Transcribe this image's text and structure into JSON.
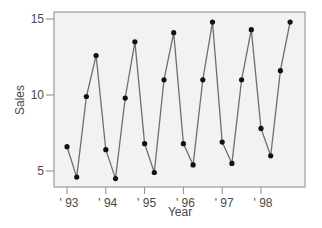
{
  "chart_data": {
    "type": "line",
    "title": "",
    "xlabel": "Year",
    "ylabel": "Sales",
    "ylim": [
      4,
      15.5
    ],
    "yticks": [
      5,
      10,
      15
    ],
    "xtick_labels": [
      "' 93",
      "' 94",
      "' 95",
      "' 96",
      "' 97",
      "' 98"
    ],
    "grid": false,
    "legend": null,
    "series": [
      {
        "name": "Sales",
        "quarters": [
          "93Q1",
          "93Q2",
          "93Q3",
          "93Q4",
          "94Q1",
          "94Q2",
          "94Q3",
          "94Q4",
          "95Q1",
          "95Q2",
          "95Q3",
          "95Q4",
          "96Q1",
          "96Q2",
          "96Q3",
          "96Q4",
          "97Q1",
          "97Q2",
          "97Q3",
          "97Q4",
          "98Q1",
          "98Q2",
          "98Q3",
          "98Q4"
        ],
        "values": [
          6.6,
          4.6,
          9.9,
          12.6,
          6.4,
          4.5,
          9.8,
          13.5,
          6.8,
          4.9,
          11.0,
          14.1,
          6.8,
          5.4,
          11.0,
          14.8,
          6.9,
          5.5,
          11.0,
          14.3,
          7.8,
          6.0,
          11.6,
          14.8
        ]
      }
    ]
  },
  "colors": {
    "plot_background": "#f2f2f2",
    "line": "#6e6e6e",
    "marker": "#111111",
    "axis": "#8a8a8a",
    "text": "#4a4a4a"
  }
}
